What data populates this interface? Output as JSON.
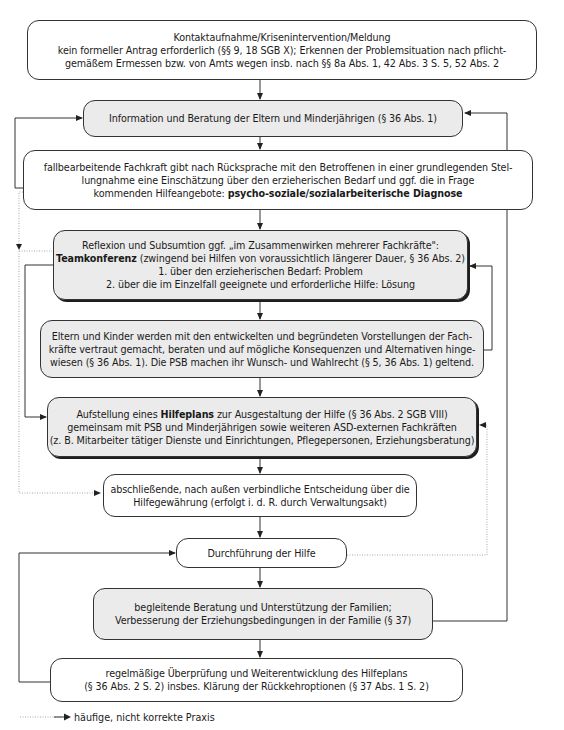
{
  "colors": {
    "box_fill_gray": "#ebebeb",
    "box_fill_white": "#ffffff",
    "line": "#333333",
    "dotted": "#999999"
  },
  "steps": [
    {
      "id": "kontakt",
      "style": "white",
      "lines": [
        "Kontaktaufnahme/Krisenintervention/Meldung",
        "kein formeller Antrag erforderlich (§§ 9, 18 SGB X); Erkennen der Problemsituation nach pflicht-",
        "gemäßem Ermessen bzw. von Amts wegen insb. nach §§ 8a Abs. 1, 42 Abs. 3 S. 5, 52 Abs. 2"
      ]
    },
    {
      "id": "information",
      "style": "gray",
      "lines": [
        "Information und Beratung der Eltern und Minderjährigen (§ 36 Abs. 1)"
      ]
    },
    {
      "id": "diagnose",
      "style": "white",
      "lines": [
        "fallbearbeitende Fachkraft gibt nach Rücksprache mit den Betroffenen in einer grundlegenden Stel-",
        "lungnahme eine Einschätzung über den erzieherischen Bedarf und ggf. die in Frage"
      ],
      "line3_prefix": "kommenden Hilfeangebote: ",
      "line3_bold": "psycho-soziale/sozialarbeiterische Diagnose"
    },
    {
      "id": "teamkonferenz",
      "style": "gray-shadow",
      "line1": "Reflexion und Subsumtion ggf. „im Zusammenwirken mehrerer Fachkräfte\":",
      "line2_bold": "Teamkonferenz",
      "line2_rest": " (zwingend bei Hilfen von voraussichtlich längerer Dauer, § 36 Abs. 2)",
      "line3": "1. über den erzieherischen Bedarf: Problem",
      "line4": "2. über die im Einzelfall geeignete und erforderliche Hilfe: Lösung"
    },
    {
      "id": "eltern",
      "style": "gray",
      "lines": [
        "Eltern und Kinder werden mit den entwickelten und begründeten Vorstellungen der Fach-",
        "kräfte vertraut gemacht, beraten und auf mögliche Konsequenzen und Alternativen hinge-",
        "wiesen (§ 36 Abs. 1). Die PSB machen ihr Wunsch- und Wahlrecht (§ 5, 36 Abs. 1) geltend."
      ]
    },
    {
      "id": "hilfeplan",
      "style": "gray-shadow",
      "line1_prefix": "Aufstellung eines ",
      "line1_bold": "Hilfeplans",
      "line1_rest": " zur Ausgestaltung der Hilfe (§ 36 Abs. 2 SGB VIII)",
      "line2": "gemeinsam mit PSB und Minderjährigen sowie weiteren ASD-externen Fachkräften",
      "line3": "(z. B. Mitarbeiter tätiger Dienste und Einrichtungen, Pflegepersonen, Erziehungsberatung)"
    },
    {
      "id": "entscheidung",
      "style": "white",
      "lines": [
        "abschließende, nach außen verbindliche Entscheidung über die",
        "Hilfegewährung (erfolgt i. d. R. durch Verwaltungsakt)"
      ]
    },
    {
      "id": "durchfuehrung",
      "style": "white",
      "lines": [
        "Durchführung der Hilfe"
      ]
    },
    {
      "id": "begleitung",
      "style": "gray",
      "lines": [
        "begleitende Beratung und Unterstützung der Familien;",
        "Verbesserung der Erziehungsbedingungen in der Familie (§ 37)"
      ]
    },
    {
      "id": "ueberpruefung",
      "style": "white",
      "lines": [
        "regelmäßige Überprüfung und Weiterentwicklung des Hilfeplans",
        "(§ 36 Abs. 2 S. 2) insbes. Klärung der Rückkehroptionen (§ 37 Abs. 1 S. 2)"
      ]
    }
  ],
  "legend": {
    "dotted_arrow_label": "häufige, nicht korrekte Praxis"
  }
}
